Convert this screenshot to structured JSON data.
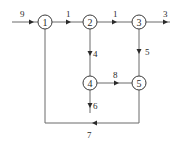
{
  "diagram": {
    "type": "flow-network",
    "nodes": [
      {
        "id": "1",
        "label": "1",
        "x": 45,
        "y": 22
      },
      {
        "id": "2",
        "label": "2",
        "x": 90,
        "y": 22
      },
      {
        "id": "3",
        "label": "3",
        "x": 139,
        "y": 22
      },
      {
        "id": "4",
        "label": "4",
        "x": 90,
        "y": 83
      },
      {
        "id": "5",
        "label": "5",
        "x": 139,
        "y": 83
      }
    ],
    "edges": [
      {
        "id": "9",
        "label": "9",
        "from": "input",
        "to": "1"
      },
      {
        "id": "1",
        "label": "1",
        "from": "1",
        "to": "2"
      },
      {
        "id": "2",
        "label": "2",
        "from": "2",
        "to": "3"
      },
      {
        "id": "3",
        "label": "3",
        "from": "3",
        "to": "output"
      },
      {
        "id": "4",
        "label": "4",
        "from": "2",
        "to": "4"
      },
      {
        "id": "5",
        "label": "5",
        "from": "3",
        "to": "5"
      },
      {
        "id": "8",
        "label": "8",
        "from": "4",
        "to": "5"
      },
      {
        "id": "6",
        "label": "6",
        "from": "4",
        "to": "output"
      },
      {
        "id": "7",
        "label": "7",
        "from": "5",
        "to": "1"
      }
    ]
  }
}
